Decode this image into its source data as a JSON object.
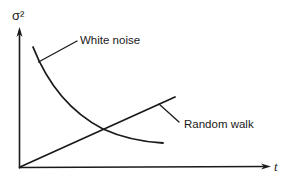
{
  "diagram": {
    "title": "",
    "y_axis_label": "σ²",
    "x_axis_label": "t",
    "curves": [
      {
        "name": "White noise",
        "shape": "decreasing hyperbola-like curve"
      },
      {
        "name": "Random walk",
        "shape": "increasing straight line from origin"
      }
    ],
    "labels": {
      "white_noise": "White noise",
      "random_walk": "Random walk"
    },
    "colors": {
      "ink": "#1a1a1a",
      "background": "#ffffff"
    }
  }
}
